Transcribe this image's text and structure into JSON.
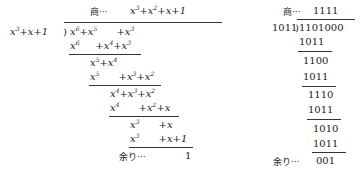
{
  "polynomial": {
    "quotient_label": "商···",
    "quotient": "x³+x²+x+1",
    "divisor": "x³+x+1",
    "dividend": "x⁶+x⁵ +x³",
    "steps": [
      {
        "subtract": "x⁶ +x⁴+x³",
        "result": "x⁵+x⁴"
      },
      {
        "subtract": "x⁵ +x³+x²",
        "result": "x⁴+x³+x²"
      },
      {
        "subtract": "x⁴ +x²+x",
        "result": "x³ +x"
      },
      {
        "subtract": "x³ +x+1",
        "result": "1"
      }
    ],
    "remainder_label": "余り···",
    "remainder": "1"
  },
  "binary": {
    "quotient_label": "商···",
    "quotient": "1111",
    "divisor": "1011",
    "dividend": "1101000",
    "rows": [
      "1011",
      "1100",
      "1011",
      "1110",
      "1011",
      "1010",
      "1011"
    ],
    "remainder_label": "余り···",
    "remainder": "001"
  }
}
